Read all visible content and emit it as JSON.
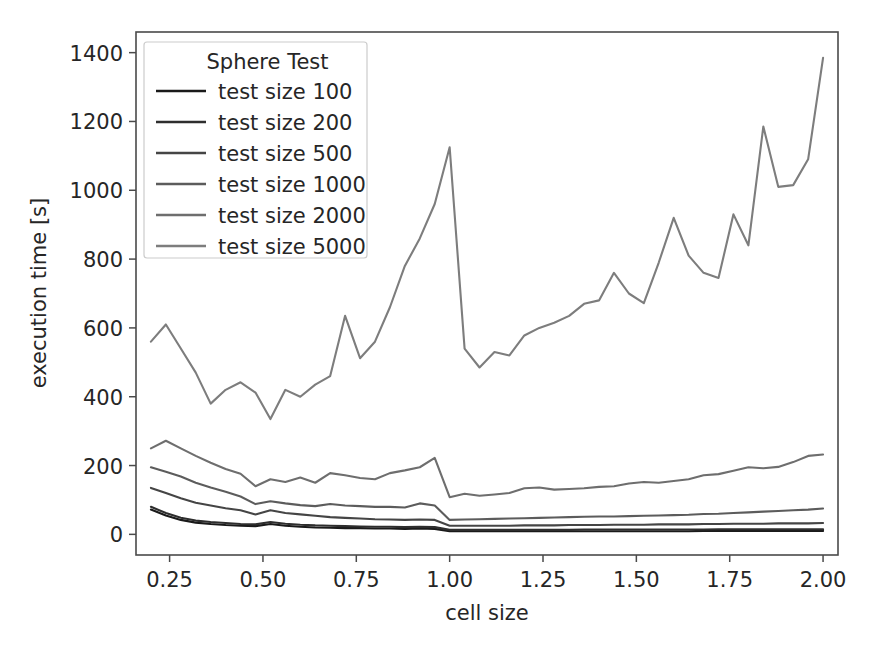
{
  "figure": {
    "width": 879,
    "height": 648,
    "background": "#ffffff"
  },
  "chart_data": {
    "type": "line",
    "title": "",
    "xlabel": "cell size",
    "ylabel": "execution time [s]",
    "xlim": [
      0.16,
      2.04
    ],
    "ylim": [
      -60,
      1460
    ],
    "xticks": [
      0.25,
      0.5,
      0.75,
      1.0,
      1.25,
      1.5,
      1.75,
      2.0
    ],
    "xticklabels": [
      "0.25",
      "0.50",
      "0.75",
      "1.00",
      "1.25",
      "1.50",
      "1.75",
      "2.00"
    ],
    "yticks": [
      0,
      200,
      400,
      600,
      800,
      1000,
      1200,
      1400
    ],
    "yticklabels": [
      "0",
      "200",
      "400",
      "600",
      "800",
      "1000",
      "1200",
      "1400"
    ],
    "grid": false,
    "legend": {
      "title": "Sphere Test",
      "position": "upper left",
      "entries": [
        "test size 100",
        "test size 200",
        "test size 500",
        "test size 1000",
        "test size 2000",
        "test size 5000"
      ]
    },
    "x": [
      0.2,
      0.24,
      0.28,
      0.32,
      0.36,
      0.4,
      0.44,
      0.48,
      0.52,
      0.56,
      0.6,
      0.64,
      0.68,
      0.72,
      0.76,
      0.8,
      0.84,
      0.88,
      0.92,
      0.96,
      1.0,
      1.04,
      1.08,
      1.12,
      1.16,
      1.2,
      1.24,
      1.28,
      1.32,
      1.36,
      1.4,
      1.44,
      1.48,
      1.52,
      1.56,
      1.6,
      1.64,
      1.68,
      1.72,
      1.76,
      1.8,
      1.84,
      1.88,
      1.92,
      1.96,
      2.0
    ],
    "series": [
      {
        "name": "test size 100",
        "color": "#1a1a1a",
        "values": [
          72,
          55,
          42,
          34,
          30,
          27,
          25,
          24,
          30,
          25,
          22,
          20,
          19,
          18,
          18,
          17,
          17,
          16,
          17,
          16,
          9,
          9,
          9,
          9,
          9,
          9,
          9,
          9,
          9,
          9,
          9,
          9,
          9,
          9,
          9,
          9,
          9,
          10,
          10,
          10,
          10,
          10,
          10,
          10,
          10,
          10
        ]
      },
      {
        "name": "test size 200",
        "color": "#2e2e2e",
        "values": [
          80,
          62,
          48,
          40,
          36,
          33,
          30,
          29,
          36,
          31,
          28,
          26,
          25,
          24,
          23,
          22,
          22,
          21,
          22,
          21,
          13,
          13,
          13,
          13,
          13,
          13,
          13,
          13,
          13,
          14,
          14,
          14,
          14,
          14,
          14,
          14,
          14,
          14,
          15,
          15,
          15,
          15,
          15,
          15,
          15,
          15
        ]
      },
      {
        "name": "test size 500",
        "color": "#454545",
        "values": [
          135,
          120,
          105,
          92,
          84,
          76,
          70,
          58,
          70,
          62,
          58,
          54,
          50,
          48,
          46,
          44,
          43,
          42,
          43,
          42,
          25,
          25,
          25,
          25,
          25,
          26,
          26,
          26,
          27,
          27,
          27,
          28,
          28,
          28,
          29,
          29,
          29,
          30,
          30,
          31,
          31,
          31,
          32,
          32,
          32,
          33
        ]
      },
      {
        "name": "test size 1000",
        "color": "#5c5c5c",
        "values": [
          195,
          182,
          168,
          150,
          136,
          124,
          110,
          88,
          96,
          90,
          85,
          82,
          88,
          84,
          82,
          80,
          80,
          78,
          90,
          84,
          42,
          43,
          44,
          45,
          46,
          47,
          48,
          49,
          50,
          51,
          52,
          52,
          53,
          54,
          55,
          56,
          57,
          59,
          60,
          62,
          64,
          66,
          68,
          70,
          72,
          75
        ]
      },
      {
        "name": "test size 2000",
        "color": "#6e6e6e",
        "values": [
          250,
          272,
          250,
          228,
          208,
          190,
          176,
          140,
          160,
          152,
          165,
          150,
          178,
          172,
          164,
          160,
          178,
          186,
          195,
          222,
          108,
          118,
          112,
          116,
          120,
          134,
          136,
          130,
          132,
          134,
          138,
          140,
          148,
          152,
          150,
          155,
          160,
          172,
          175,
          185,
          195,
          192,
          196,
          210,
          228,
          232
        ]
      },
      {
        "name": "test size 5000",
        "color": "#7d7d7d",
        "values": [
          560,
          610,
          540,
          470,
          380,
          420,
          442,
          412,
          335,
          420,
          400,
          435,
          460,
          635,
          512,
          560,
          660,
          780,
          860,
          960,
          1125,
          540,
          485,
          530,
          520,
          578,
          600,
          615,
          635,
          670,
          680,
          760,
          700,
          672,
          790,
          920,
          810,
          760,
          745,
          930,
          840,
          1185,
          1010,
          1015,
          1090,
          1385
        ]
      }
    ]
  }
}
